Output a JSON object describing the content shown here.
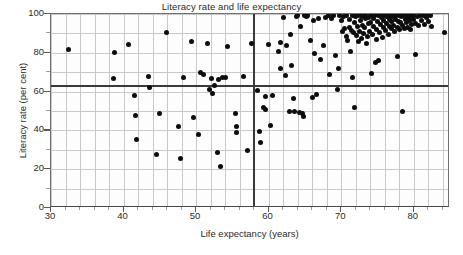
{
  "chart_data": {
    "type": "scatter",
    "title": "Literacy rate and life expectancy",
    "xlabel": "Life expectancy (years)",
    "ylabel": "Literacy rate (per cent)",
    "xlim": [
      30,
      85
    ],
    "ylim": [
      0,
      100
    ],
    "xticks": [
      30,
      40,
      50,
      60,
      70,
      80
    ],
    "yticks": [
      0,
      20,
      40,
      60,
      80,
      100
    ],
    "xtick_labels": [
      "30",
      "40",
      "50",
      "60",
      "70",
      "80"
    ],
    "ytick_labels": [
      "0",
      "20",
      "40",
      "60",
      "80",
      "100"
    ],
    "x_minor_step": 2,
    "y_minor_step": 10,
    "grid": true,
    "grid_color": "#c9c9c9",
    "legend": null,
    "marker_color": "#0d0d0d",
    "reference_lines": [
      {
        "orientation": "horizontal",
        "value": 63,
        "label": "mean literacy rate",
        "color": "#3a3a3a"
      },
      {
        "orientation": "vertical",
        "value": 58,
        "label": "mean life expectancy",
        "color": "#3a3a3a"
      }
    ],
    "series": [
      {
        "name": "Countries",
        "points": [
          [
            32.4,
            81.5
          ],
          [
            38.6,
            66.8
          ],
          [
            38.8,
            80.4
          ],
          [
            40.7,
            84.3
          ],
          [
            41.5,
            57.8
          ],
          [
            41.6,
            47.6
          ],
          [
            41.8,
            35.2
          ],
          [
            43.4,
            67.6
          ],
          [
            43.6,
            62.0
          ],
          [
            44.6,
            27.7
          ],
          [
            44.9,
            48.8
          ],
          [
            45.9,
            90.3
          ],
          [
            47.6,
            42.1
          ],
          [
            47.8,
            25.6
          ],
          [
            48.3,
            67.5
          ],
          [
            49.4,
            86.0
          ],
          [
            49.6,
            46.4
          ],
          [
            50.3,
            37.8
          ],
          [
            50.6,
            69.8
          ],
          [
            51.0,
            69.0
          ],
          [
            51.6,
            84.8
          ],
          [
            51.9,
            61.2
          ],
          [
            52.1,
            66.5
          ],
          [
            52.3,
            59.2
          ],
          [
            52.6,
            63.0
          ],
          [
            53.0,
            28.6
          ],
          [
            53.1,
            66.2
          ],
          [
            53.4,
            21.6
          ],
          [
            53.7,
            67.3
          ],
          [
            54.1,
            67.1
          ],
          [
            54.3,
            83.5
          ],
          [
            55.4,
            48.7
          ],
          [
            55.6,
            41.8
          ],
          [
            55.6,
            39.1
          ],
          [
            56.6,
            67.9
          ],
          [
            57.1,
            29.4
          ],
          [
            57.6,
            84.7
          ],
          [
            58.5,
            60.6
          ],
          [
            58.7,
            39.3
          ],
          [
            58.9,
            33.9
          ],
          [
            59.3,
            51.9
          ],
          [
            59.5,
            50.6
          ],
          [
            59.6,
            57.6
          ],
          [
            60.0,
            84.2
          ],
          [
            60.3,
            42.6
          ],
          [
            60.6,
            58.2
          ],
          [
            61.4,
            80.5
          ],
          [
            61.6,
            85.2
          ],
          [
            61.7,
            71.9
          ],
          [
            62.1,
            98.4
          ],
          [
            62.3,
            68.5
          ],
          [
            62.5,
            84.0
          ],
          [
            62.9,
            49.9
          ],
          [
            63.0,
            89.5
          ],
          [
            63.2,
            73.2
          ],
          [
            63.4,
            56.2
          ],
          [
            63.5,
            49.7
          ],
          [
            63.8,
            98.6
          ],
          [
            64.0,
            99.3
          ],
          [
            64.2,
            49.2
          ],
          [
            64.4,
            93.7
          ],
          [
            64.6,
            48.6
          ],
          [
            64.8,
            47.0
          ],
          [
            64.9,
            99.2
          ],
          [
            65.2,
            98.8
          ],
          [
            65.4,
            99.3
          ],
          [
            65.8,
            86.4
          ],
          [
            66.0,
            57.1
          ],
          [
            66.2,
            96.9
          ],
          [
            66.3,
            79.8
          ],
          [
            66.6,
            58.4
          ],
          [
            66.9,
            97.9
          ],
          [
            67.2,
            76.4
          ],
          [
            67.5,
            83.7
          ],
          [
            67.8,
            98.2
          ],
          [
            68.2,
            99.0
          ],
          [
            68.4,
            68.6
          ],
          [
            68.6,
            97.5
          ],
          [
            68.9,
            99.4
          ],
          [
            69.2,
            78.5
          ],
          [
            69.5,
            61.0
          ],
          [
            69.6,
            71.7
          ],
          [
            69.8,
            99.0
          ],
          [
            70.0,
            96.8
          ],
          [
            70.2,
            90.9
          ],
          [
            70.3,
            98.7
          ],
          [
            70.5,
            92.5
          ],
          [
            70.7,
            88.2
          ],
          [
            70.8,
            99.1
          ],
          [
            70.9,
            86.5
          ],
          [
            71.1,
            93.2
          ],
          [
            71.2,
            97.0
          ],
          [
            71.3,
            80.7
          ],
          [
            71.4,
            91.6
          ],
          [
            71.5,
            99.2
          ],
          [
            71.6,
            67.2
          ],
          [
            71.7,
            90.3
          ],
          [
            71.8,
            95.4
          ],
          [
            71.9,
            52.0
          ],
          [
            72.0,
            98.5
          ],
          [
            72.1,
            88.9
          ],
          [
            72.2,
            93.8
          ],
          [
            72.3,
            99.3
          ],
          [
            72.4,
            85.6
          ],
          [
            72.5,
            91.2
          ],
          [
            72.6,
            96.5
          ],
          [
            72.7,
            99.0
          ],
          [
            72.8,
            87.4
          ],
          [
            72.9,
            94.3
          ],
          [
            73.0,
            98.8
          ],
          [
            73.1,
            90.1
          ],
          [
            73.2,
            92.8
          ],
          [
            73.3,
            97.6
          ],
          [
            73.4,
            99.2
          ],
          [
            73.5,
            84.7
          ],
          [
            73.6,
            88.3
          ],
          [
            73.7,
            94.9
          ],
          [
            73.8,
            98.4
          ],
          [
            73.9,
            91.0
          ],
          [
            74.0,
            95.7
          ],
          [
            74.1,
            99.1
          ],
          [
            74.2,
            69.1
          ],
          [
            74.3,
            89.5
          ],
          [
            74.4,
            93.4
          ],
          [
            74.5,
            97.8
          ],
          [
            74.6,
            99.3
          ],
          [
            74.7,
            74.8
          ],
          [
            74.8,
            86.9
          ],
          [
            74.9,
            92.1
          ],
          [
            75.0,
            96.2
          ],
          [
            75.1,
            99.0
          ],
          [
            75.2,
            76.2
          ],
          [
            75.3,
            90.6
          ],
          [
            75.4,
            94.5
          ],
          [
            75.5,
            98.1
          ],
          [
            75.6,
            99.2
          ],
          [
            75.7,
            87.8
          ],
          [
            75.8,
            92.9
          ],
          [
            75.9,
            96.7
          ],
          [
            76.0,
            99.4
          ],
          [
            76.1,
            91.4
          ],
          [
            76.2,
            95.1
          ],
          [
            76.3,
            98.6
          ],
          [
            76.4,
            99.1
          ],
          [
            76.5,
            89.2
          ],
          [
            76.6,
            93.6
          ],
          [
            76.7,
            97.2
          ],
          [
            76.8,
            99.3
          ],
          [
            76.9,
            92.3
          ],
          [
            77.0,
            96.0
          ],
          [
            77.1,
            98.9
          ],
          [
            77.2,
            94.1
          ],
          [
            77.3,
            99.2
          ],
          [
            77.4,
            90.8
          ],
          [
            77.5,
            97.4
          ],
          [
            77.6,
            99.0
          ],
          [
            77.7,
            78.3
          ],
          [
            77.8,
            93.0
          ],
          [
            77.9,
            96.3
          ],
          [
            78.0,
            99.3
          ],
          [
            78.1,
            91.8
          ],
          [
            78.2,
            95.5
          ],
          [
            78.3,
            98.7
          ],
          [
            78.4,
            49.6
          ],
          [
            78.5,
            94.2
          ],
          [
            78.6,
            99.1
          ],
          [
            78.7,
            92.6
          ],
          [
            78.8,
            97.1
          ],
          [
            78.9,
            99.4
          ],
          [
            79.0,
            95.8
          ],
          [
            79.1,
            98.3
          ],
          [
            79.2,
            93.3
          ],
          [
            79.3,
            99.2
          ],
          [
            79.4,
            96.6
          ],
          [
            79.5,
            91.9
          ],
          [
            79.6,
            98.8
          ],
          [
            79.7,
            94.7
          ],
          [
            79.8,
            99.0
          ],
          [
            79.9,
            97.3
          ],
          [
            80.0,
            99.3
          ],
          [
            80.2,
            79.2
          ],
          [
            80.3,
            95.2
          ],
          [
            80.5,
            98.5
          ],
          [
            80.7,
            93.9
          ],
          [
            80.9,
            99.1
          ],
          [
            81.1,
            96.4
          ],
          [
            81.3,
            99.2
          ],
          [
            81.5,
            94.8
          ],
          [
            81.7,
            98.0
          ],
          [
            81.9,
            99.3
          ],
          [
            82.1,
            96.1
          ],
          [
            82.3,
            99.0
          ],
          [
            82.5,
            93.5
          ],
          [
            84.3,
            90.5
          ]
        ]
      }
    ]
  }
}
